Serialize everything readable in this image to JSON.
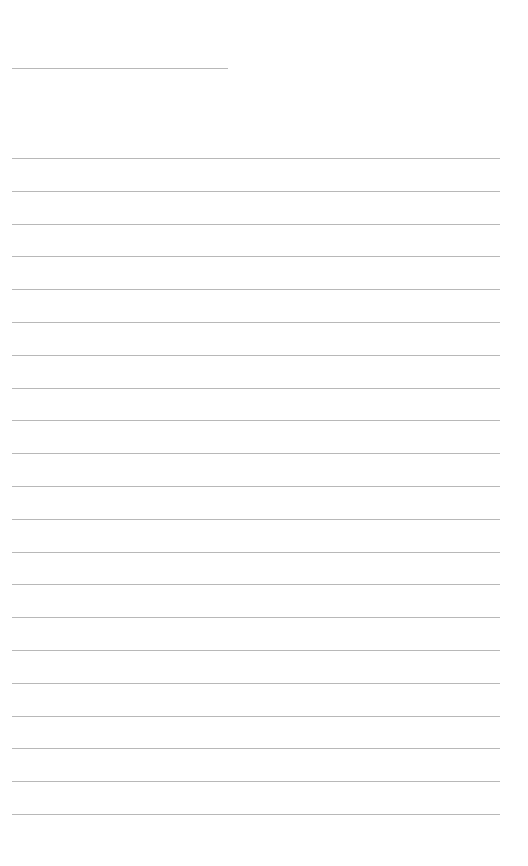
{
  "page": {
    "type": "blank lined sheet",
    "title_line": {
      "x": 12,
      "y": 68,
      "width": 216
    },
    "rules": {
      "count": 21,
      "start_y": 158,
      "spacing": 32.8,
      "x": 12,
      "width": 488,
      "color": "#b8b8b8"
    }
  }
}
